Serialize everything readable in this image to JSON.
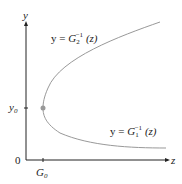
{
  "axes": {
    "x_label": "z",
    "y_label": "y",
    "origin_label": "0",
    "x_tick_label": "G",
    "x_tick_sub": "0",
    "y_tick_label": "y",
    "y_tick_sub": "0"
  },
  "curves": {
    "upper": {
      "prefix": "y = ",
      "G": "G",
      "sub": "2",
      "sup": "−1",
      "arg": " (z)"
    },
    "lower": {
      "prefix": "y = ",
      "G": "G",
      "sub": "1",
      "sup": "−1",
      "arg": " (z)"
    }
  },
  "colors": {
    "axis": "#222222",
    "curve": "#999999",
    "point": "#999999"
  }
}
